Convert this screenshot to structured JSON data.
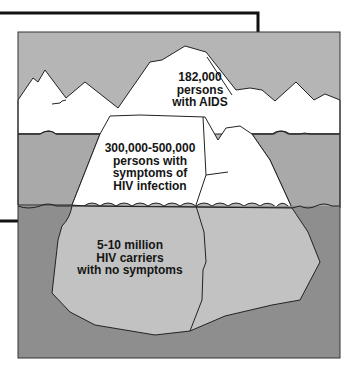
{
  "diagram": {
    "colors": {
      "sky": "#b5b5b5",
      "ice": "#ffffff",
      "shallow_water": "#a9a9a9",
      "deep_water": "#8e8e8e",
      "submerged_ice": "#c2c2c2",
      "outline": "#222222",
      "frame_line": "#111111"
    },
    "tiers": [
      {
        "id": "tip",
        "lines": [
          "182,000",
          "persons",
          "with AIDS"
        ]
      },
      {
        "id": "middle",
        "lines": [
          "300,000-500,000",
          "persons with",
          "symptoms of",
          "HIV infection"
        ]
      },
      {
        "id": "base",
        "lines": [
          "5-10 million",
          "HIV carriers",
          "with no symptoms"
        ]
      }
    ]
  }
}
